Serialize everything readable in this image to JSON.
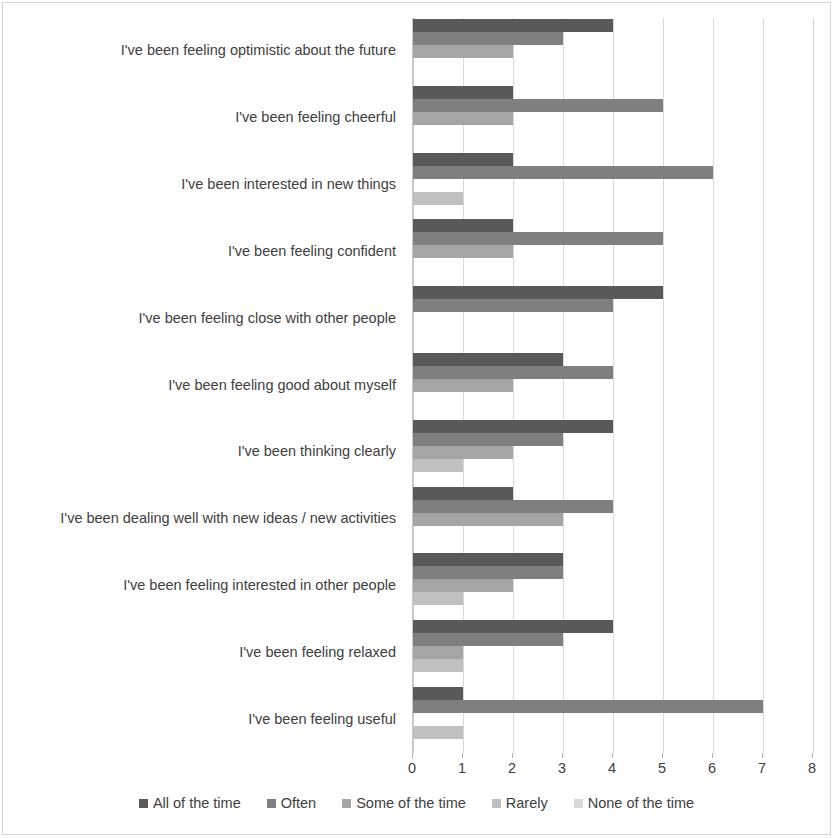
{
  "chart_data": {
    "type": "bar",
    "orientation": "horizontal",
    "title": "",
    "subtitle": "",
    "xlabel": "",
    "ylabel": "",
    "xlim": [
      0,
      8
    ],
    "xticks": [
      "0",
      "1",
      "2",
      "3",
      "4",
      "5",
      "6",
      "7",
      "8"
    ],
    "grid": true,
    "legend_position": "bottom",
    "categories": [
      "I've been feeling optimistic about the future",
      "I've been feeling cheerful",
      "I've been interested in new things",
      "I've been feeling confident",
      "I've been feeling close with other people",
      "I've been feeling good about myself",
      "I've been thinking clearly",
      "I've been dealing well with new ideas / new activities",
      "I've been feeling interested in other people",
      "I've been feeling relaxed",
      "I've been feeling useful"
    ],
    "series": [
      {
        "name": "All of the time",
        "color": "#595959",
        "values": [
          4,
          2,
          2,
          2,
          5,
          3,
          4,
          2,
          3,
          4,
          1
        ]
      },
      {
        "name": "Often",
        "color": "#7f7f7f",
        "values": [
          3,
          5,
          6,
          5,
          4,
          4,
          3,
          4,
          3,
          3,
          7
        ]
      },
      {
        "name": "Some of the time",
        "color": "#a5a5a5",
        "values": [
          2,
          2,
          0,
          2,
          0,
          2,
          2,
          3,
          2,
          1,
          0
        ]
      },
      {
        "name": "Rarely",
        "color": "#c0c0c0",
        "values": [
          0,
          0,
          1,
          0,
          0,
          0,
          1,
          0,
          1,
          1,
          1
        ]
      },
      {
        "name": "None of the time",
        "color": "#d9d9d9",
        "values": [
          0,
          0,
          0,
          0,
          0,
          0,
          0,
          0,
          0,
          0,
          0
        ]
      }
    ]
  },
  "colors": {
    "gridline": "#d9d9d9",
    "axis_text": "#404040",
    "frame": "#d4d4d4",
    "background": "#ffffff"
  }
}
